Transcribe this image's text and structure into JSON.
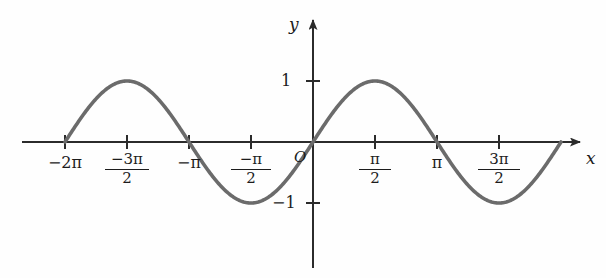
{
  "chart_data": {
    "type": "line",
    "title": "",
    "subtitle": "",
    "xlabel": "x",
    "ylabel": "y",
    "function": "y = sin(x)",
    "grid": false,
    "legend": "none",
    "origin_label": "O",
    "xlim": [
      -6.8,
      7.1
    ],
    "ylim": [
      -1.55,
      1.75
    ],
    "x_tick_values": [
      -6.283185,
      -4.712389,
      -3.141593,
      -1.570796,
      1.570796,
      3.141593,
      4.712389
    ],
    "x_tick_labels": [
      "-2π",
      "-3π/2",
      "-π",
      "-π/2",
      "π/2",
      "π",
      "3π/2"
    ],
    "y_tick_values": [
      1,
      -1
    ],
    "y_tick_labels": [
      "1",
      "-1"
    ],
    "curve_color": "#6b6b6b",
    "axis_color": "#2b2b2b",
    "x": [
      -6.283185,
      -5.890486,
      -5.497787,
      -5.105088,
      -4.712389,
      -4.31969,
      -3.926991,
      -3.534292,
      -3.141593,
      -2.748894,
      -2.356194,
      -1.963495,
      -1.570796,
      -1.178097,
      -0.785398,
      -0.392699,
      0,
      0.392699,
      0.785398,
      1.178097,
      1.570796,
      1.963495,
      2.356194,
      2.748894,
      3.141593,
      3.534292,
      3.926991,
      4.31969,
      4.712389,
      5.105088,
      5.497787,
      5.890486,
      6.283185
    ],
    "y": [
      0,
      0.382683,
      0.707107,
      0.92388,
      1,
      0.92388,
      0.707107,
      0.382683,
      0,
      -0.382683,
      -0.707107,
      -0.92388,
      -1,
      -0.92388,
      -0.707107,
      -0.382683,
      0,
      0.382683,
      0.707107,
      0.92388,
      1,
      0.92388,
      0.707107,
      0.382683,
      0,
      -0.382683,
      -0.707107,
      -0.92388,
      -1,
      -0.92388,
      -0.707107,
      -0.382683,
      0
    ],
    "maxima": [
      {
        "x": -4.712389,
        "y": 1
      },
      {
        "x": 1.570796,
        "y": 1
      }
    ],
    "minima": [
      {
        "x": -1.570796,
        "y": -1
      },
      {
        "x": 4.712389,
        "y": -1
      }
    ],
    "zeros": [
      -6.283185,
      -3.141593,
      0,
      3.141593,
      6.283185
    ]
  },
  "labels": {
    "y_axis": "y",
    "x_axis": "x",
    "origin": "O",
    "y_one": "1",
    "y_neg_one": "−1",
    "x_neg_two_pi": "−2π",
    "x_neg_pi": "−π",
    "x_pi": "π",
    "frac_neg_three_pi_over_two": {
      "num": "−3π",
      "den": "2"
    },
    "frac_neg_pi_over_two": {
      "num": "−π",
      "den": "2"
    },
    "frac_pi_over_two": {
      "num": "π",
      "den": "2"
    },
    "frac_three_pi_over_two": {
      "num": "3π",
      "den": "2"
    }
  }
}
